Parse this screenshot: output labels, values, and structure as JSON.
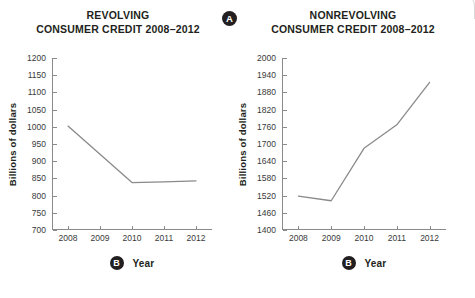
{
  "figure": {
    "callout_a": "A",
    "callout_b": "B"
  },
  "charts": [
    {
      "id": "revolving",
      "title_line1": "REVOLVING",
      "title_line2": "CONSUMER CREDIT 2008–2012",
      "ylabel": "Billions of dollars",
      "xlabel": "Year",
      "chart_data": {
        "type": "line",
        "title": "REVOLVING CONSUMER CREDIT 2008–2012",
        "xlabel": "Year",
        "ylabel": "Billions of dollars",
        "categories": [
          "2008",
          "2009",
          "2010",
          "2011",
          "2012"
        ],
        "x": [
          2008,
          2009,
          2010,
          2011,
          2012
        ],
        "values": [
          1002,
          920,
          838,
          840,
          843
        ],
        "ylim": [
          700,
          1200
        ],
        "yticks": [
          700,
          750,
          800,
          850,
          900,
          950,
          1000,
          1050,
          1100,
          1150,
          1200
        ],
        "xlim": [
          2007.5,
          2012.5
        ],
        "grid": false,
        "legend": false,
        "line_color": "#8a8a8a"
      }
    },
    {
      "id": "nonrevolving",
      "title_line1": "NONREVOLVING",
      "title_line2": "CONSUMER CREDIT 2008–2012",
      "ylabel": "Billions of dollars",
      "xlabel": "Year",
      "chart_data": {
        "type": "line",
        "title": "NONREVOLVING CONSUMER CREDIT 2008–2012",
        "xlabel": "Year",
        "ylabel": "Billions of dollars",
        "categories": [
          "2008",
          "2009",
          "2010",
          "2011",
          "2012"
        ],
        "x": [
          2008,
          2009,
          2010,
          2011,
          2012
        ],
        "values": [
          1518,
          1502,
          1685,
          1767,
          1915
        ],
        "ylim": [
          1400,
          2000
        ],
        "yticks": [
          1400,
          1460,
          1520,
          1580,
          1640,
          1700,
          1760,
          1820,
          1880,
          1940,
          2000
        ],
        "xlim": [
          2007.5,
          2012.5
        ],
        "grid": false,
        "legend": false,
        "line_color": "#8a8a8a"
      }
    }
  ]
}
